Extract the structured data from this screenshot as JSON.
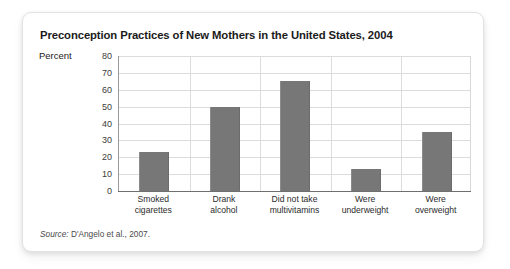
{
  "figure": {
    "title": "Preconception Practices of New Mothers in the United States, 2004",
    "source_word": "Source:",
    "source_text": " D'Angelo et al., 2007."
  },
  "colors": {
    "bar": "#777777",
    "grid": "#dcdcdc",
    "axis": "#6f6f6f",
    "card_border": "#e2e2e2",
    "text": "#1b1b1b"
  },
  "chart_data": {
    "type": "bar",
    "title": "Preconception Practices of New Mothers in the United States, 2004",
    "categories": [
      "Smoked\ncigarettes",
      "Drank\nalcohol",
      "Did not take\nmultivitamins",
      "Were\nunderweight",
      "Were\noverweight"
    ],
    "category_lines": [
      [
        "Smoked",
        "cigarettes"
      ],
      [
        "Drank",
        "alcohol"
      ],
      [
        "Did not take",
        "multivitamins"
      ],
      [
        "Were",
        "underweight"
      ],
      [
        "Were",
        "overweight"
      ]
    ],
    "values": [
      23,
      50,
      65,
      13,
      35
    ],
    "xlabel": "",
    "ylabel": "Percent",
    "ylim": [
      0,
      80
    ],
    "yticks": [
      80,
      70,
      60,
      50,
      40,
      30,
      20,
      10,
      0
    ],
    "ytick_labels": [
      "80",
      "70",
      "60",
      "50",
      "40",
      "30",
      "20",
      "10",
      "0"
    ],
    "grid": "horizontal-and-vertical",
    "legend": "none"
  }
}
